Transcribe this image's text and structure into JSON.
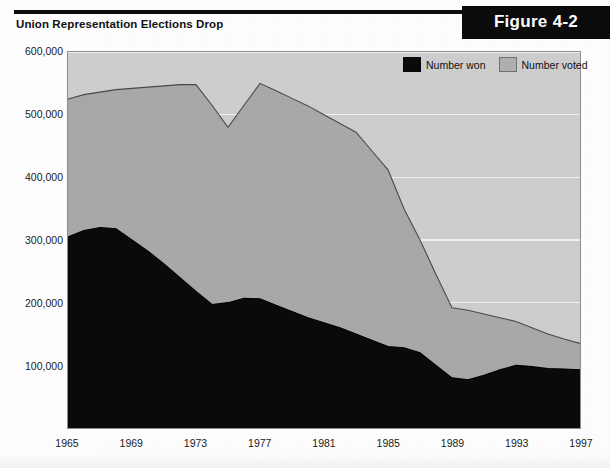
{
  "header": {
    "title": "Union Representation Elections Drop",
    "figure_label": "Figure 4-2"
  },
  "legend": {
    "position": "top-right",
    "items": [
      {
        "label": "Number won",
        "color": "#0a0a0a"
      },
      {
        "label": "Number voted",
        "color": "#b0b0b0"
      }
    ]
  },
  "colors": {
    "number_won": "#0a0a0a",
    "number_voted": "#a9a9a9",
    "plot_background": "#cfcfcf",
    "gridline": "#f2f2f2",
    "badge_background": "#0b0b0b",
    "badge_text": "#ffffff"
  },
  "chart_data": {
    "type": "area",
    "title": "Union Representation Elections Drop",
    "xlabel": "",
    "ylabel": "",
    "grid": true,
    "legend_position": "top-right",
    "stacked": false,
    "xlim": [
      1965,
      1997
    ],
    "ylim": [
      0,
      600000
    ],
    "ytick_labels": [
      "100,000",
      "200,000",
      "300,000",
      "400,000",
      "500,000",
      "600,000"
    ],
    "yticks": [
      100000,
      200000,
      300000,
      400000,
      500000,
      600000
    ],
    "xtick_labels": [
      "1965",
      "1969",
      "1973",
      "1977",
      "1981",
      "1985",
      "1989",
      "1993",
      "1997"
    ],
    "xticks": [
      1965,
      1969,
      1973,
      1977,
      1981,
      1985,
      1989,
      1993,
      1997
    ],
    "x": [
      1965,
      1966,
      1967,
      1968,
      1969,
      1970,
      1971,
      1972,
      1973,
      1974,
      1975,
      1976,
      1977,
      1978,
      1979,
      1980,
      1981,
      1982,
      1983,
      1984,
      1985,
      1986,
      1987,
      1988,
      1989,
      1990,
      1991,
      1992,
      1993,
      1994,
      1995,
      1996,
      1997
    ],
    "series": [
      {
        "name": "Number voted",
        "color": "#a9a9a9",
        "values": [
          525000,
          532000,
          536000,
          540000,
          542000,
          544000,
          546000,
          548000,
          548000,
          515000,
          480000,
          515000,
          550000,
          538000,
          526000,
          514000,
          500000,
          486000,
          472000,
          442000,
          412000,
          350000,
          300000,
          245000,
          192000,
          188000,
          182000,
          176000,
          170000,
          160000,
          150000,
          142000,
          135000
        ]
      },
      {
        "name": "Number won",
        "color": "#0a0a0a",
        "values": [
          305000,
          315000,
          320000,
          318000,
          300000,
          282000,
          262000,
          240000,
          218000,
          197000,
          200000,
          207000,
          206000,
          196000,
          186000,
          176000,
          168000,
          160000,
          150000,
          140000,
          130000,
          128000,
          120000,
          100000,
          80000,
          77000,
          84000,
          93000,
          100000,
          98000,
          95000,
          94000,
          93000
        ]
      }
    ]
  }
}
